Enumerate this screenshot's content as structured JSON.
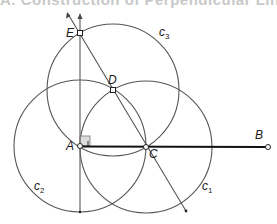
{
  "header": {
    "title_cutoff": "A. Construction of Perpendicular Line"
  },
  "diagram": {
    "points": [
      {
        "id": "A",
        "label": "A",
        "x": 80,
        "y": 146
      },
      {
        "id": "B",
        "label": "B",
        "x": 268,
        "y": 147
      },
      {
        "id": "C",
        "label": "C",
        "x": 146,
        "y": 147
      },
      {
        "id": "D",
        "label": "D",
        "x": 113,
        "y": 90
      },
      {
        "id": "E",
        "label": "E",
        "x": 80,
        "y": 33
      }
    ],
    "circles": [
      {
        "id": "c1",
        "label": "c",
        "sub": "1",
        "cx": 146,
        "cy": 147,
        "r": 66
      },
      {
        "id": "c2",
        "label": "c",
        "sub": "2",
        "cx": 80,
        "cy": 146,
        "r": 66
      },
      {
        "id": "c3",
        "label": "c",
        "sub": "3",
        "cx": 113,
        "cy": 90,
        "r": 66
      }
    ],
    "segments": [
      {
        "id": "AB",
        "from": "A",
        "to": "B",
        "style": "bold"
      }
    ],
    "rays": [
      {
        "id": "perpendicular",
        "description": "vertical line through A and E"
      },
      {
        "id": "line-CE",
        "description": "line through C, D, E"
      }
    ],
    "right_angle_marker": {
      "at": "A"
    },
    "colors": {
      "stroke": "#555555",
      "bold_stroke": "#111111",
      "marker_fill": "#dddddd"
    }
  }
}
